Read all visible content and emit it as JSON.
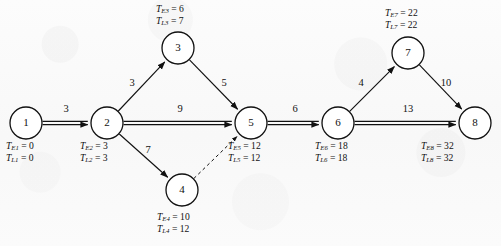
{
  "diagram": {
    "type": "project-network",
    "stroke_color": "#111111",
    "background_color": "#fbfbfb",
    "node_radius": 16
  },
  "nodes": [
    {
      "id": "1",
      "label": "1",
      "x": 26,
      "y": 123,
      "earliest_symbol": "T",
      "earliest_sub": "E1",
      "earliest": "0",
      "latest_symbol": "T",
      "latest_sub": "L1",
      "latest": "0",
      "label_x": 6,
      "label_y": 140,
      "label_align": "left"
    },
    {
      "id": "2",
      "label": "2",
      "x": 107,
      "y": 123,
      "earliest_symbol": "T",
      "earliest_sub": "E2",
      "earliest": "3",
      "latest_symbol": "T",
      "latest_sub": "L2",
      "latest": "3",
      "label_x": 80,
      "label_y": 140,
      "label_align": "left"
    },
    {
      "id": "3",
      "label": "3",
      "x": 178,
      "y": 48,
      "earliest_symbol": "T",
      "earliest_sub": "E3",
      "earliest": "6",
      "latest_symbol": "T",
      "latest_sub": "L3",
      "latest": "7",
      "label_x": 156,
      "label_y": 3,
      "label_align": "left"
    },
    {
      "id": "4",
      "label": "4",
      "x": 182,
      "y": 190,
      "earliest_symbol": "T",
      "earliest_sub": "E4",
      "earliest": "10",
      "latest_symbol": "T",
      "latest_sub": "L4",
      "latest": "12",
      "label_x": 157,
      "label_y": 211,
      "label_align": "left"
    },
    {
      "id": "5",
      "label": "5",
      "x": 251,
      "y": 123,
      "earliest_symbol": "T",
      "earliest_sub": "E5",
      "earliest": "12",
      "latest_symbol": "T",
      "latest_sub": "L5",
      "latest": "12",
      "label_x": 228,
      "label_y": 140,
      "label_align": "left"
    },
    {
      "id": "6",
      "label": "6",
      "x": 338,
      "y": 123,
      "earliest_symbol": "T",
      "earliest_sub": "E6",
      "earliest": "18",
      "latest_symbol": "T",
      "latest_sub": "L6",
      "latest": "18",
      "label_x": 315,
      "label_y": 140,
      "label_align": "left"
    },
    {
      "id": "7",
      "label": "7",
      "x": 408,
      "y": 53,
      "earliest_symbol": "T",
      "earliest_sub": "E7",
      "earliest": "22",
      "latest_symbol": "T",
      "latest_sub": "L7",
      "latest": "22",
      "label_x": 385,
      "label_y": 7,
      "label_align": "left"
    },
    {
      "id": "8",
      "label": "8",
      "x": 475,
      "y": 123,
      "earliest_symbol": "T",
      "earliest_sub": "E8",
      "earliest": "32",
      "latest_symbol": "T",
      "latest_sub": "L8",
      "latest": "32",
      "label_x": 421,
      "label_y": 140,
      "label_align": "left"
    }
  ],
  "edges": [
    {
      "id": "e1-2",
      "from": "1",
      "to": "2",
      "weight": "3",
      "style": "critical",
      "wx": 66,
      "wy": 110
    },
    {
      "id": "e2-3",
      "from": "2",
      "to": "3",
      "weight": "3",
      "style": "normal",
      "wx": 132,
      "wy": 84
    },
    {
      "id": "e2-5",
      "from": "2",
      "to": "5",
      "weight": "9",
      "style": "critical",
      "wx": 180,
      "wy": 110
    },
    {
      "id": "e2-4",
      "from": "2",
      "to": "4",
      "weight": "7",
      "style": "normal",
      "wx": 148,
      "wy": 151
    },
    {
      "id": "e3-5",
      "from": "3",
      "to": "5",
      "weight": "5",
      "style": "normal",
      "wx": 224,
      "wy": 84
    },
    {
      "id": "e4-5",
      "from": "4",
      "to": "5",
      "weight": "",
      "style": "dummy",
      "wx": 0,
      "wy": 0
    },
    {
      "id": "e5-6",
      "from": "5",
      "to": "6",
      "weight": "6",
      "style": "critical",
      "wx": 295,
      "wy": 110
    },
    {
      "id": "e6-7",
      "from": "6",
      "to": "7",
      "weight": "4",
      "style": "normal",
      "wx": 361,
      "wy": 84
    },
    {
      "id": "e6-8",
      "from": "6",
      "to": "8",
      "weight": "13",
      "style": "critical",
      "wx": 408,
      "wy": 110
    },
    {
      "id": "e7-8",
      "from": "7",
      "to": "8",
      "weight": "10",
      "style": "normal",
      "wx": 446,
      "wy": 84
    }
  ],
  "chart_data": {
    "type": "diagram",
    "critical_path": [
      "1",
      "2",
      "5",
      "6",
      "8"
    ],
    "project_duration": 32,
    "node_times": [
      {
        "node": "1",
        "TE": 0,
        "TL": 0,
        "slack": 0
      },
      {
        "node": "2",
        "TE": 3,
        "TL": 3,
        "slack": 0
      },
      {
        "node": "3",
        "TE": 6,
        "TL": 7,
        "slack": 1
      },
      {
        "node": "4",
        "TE": 10,
        "TL": 12,
        "slack": 2
      },
      {
        "node": "5",
        "TE": 12,
        "TL": 12,
        "slack": 0
      },
      {
        "node": "6",
        "TE": 18,
        "TL": 18,
        "slack": 0
      },
      {
        "node": "7",
        "TE": 22,
        "TL": 22,
        "slack": 0
      },
      {
        "node": "8",
        "TE": 32,
        "TL": 32,
        "slack": 0
      }
    ],
    "activities": [
      {
        "from": "1",
        "to": "2",
        "duration": 3,
        "dummy": false
      },
      {
        "from": "2",
        "to": "3",
        "duration": 3,
        "dummy": false
      },
      {
        "from": "2",
        "to": "5",
        "duration": 9,
        "dummy": false
      },
      {
        "from": "2",
        "to": "4",
        "duration": 7,
        "dummy": false
      },
      {
        "from": "3",
        "to": "5",
        "duration": 5,
        "dummy": false
      },
      {
        "from": "4",
        "to": "5",
        "duration": 0,
        "dummy": true
      },
      {
        "from": "5",
        "to": "6",
        "duration": 6,
        "dummy": false
      },
      {
        "from": "6",
        "to": "7",
        "duration": 4,
        "dummy": false
      },
      {
        "from": "6",
        "to": "8",
        "duration": 13,
        "dummy": false
      },
      {
        "from": "7",
        "to": "8",
        "duration": 10,
        "dummy": false
      }
    ]
  }
}
